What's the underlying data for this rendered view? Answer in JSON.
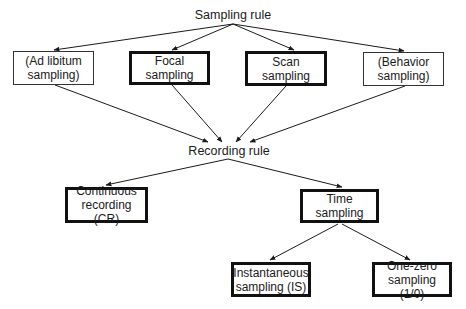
{
  "diagram": {
    "root": {
      "label": "Sampling rule"
    },
    "sampling_rules": [
      {
        "id": "ad-libitum",
        "lines": [
          "(Ad libitum",
          "sampling)"
        ],
        "emphasis": "thin"
      },
      {
        "id": "focal",
        "lines": [
          "Focal",
          "sampling"
        ],
        "emphasis": "thick"
      },
      {
        "id": "scan",
        "lines": [
          "Scan",
          "sampling"
        ],
        "emphasis": "thick"
      },
      {
        "id": "behavior",
        "lines": [
          "(Behavior",
          "sampling)"
        ],
        "emphasis": "thin"
      }
    ],
    "recording": {
      "label": "Recording rule"
    },
    "recording_rules": [
      {
        "id": "continuous",
        "lines": [
          "Continuous",
          "recording (CR)"
        ],
        "emphasis": "thick"
      },
      {
        "id": "time",
        "lines": [
          "Time sampling"
        ],
        "emphasis": "thick"
      }
    ],
    "time_sampling_types": [
      {
        "id": "instantaneous",
        "lines": [
          "Instantaneous",
          "sampling (IS)"
        ],
        "emphasis": "thick"
      },
      {
        "id": "one-zero",
        "lines": [
          "One-zero",
          "sampling (1/0)"
        ],
        "emphasis": "thick"
      }
    ],
    "edges": [
      [
        "Sampling rule",
        "(Ad libitum sampling)"
      ],
      [
        "Sampling rule",
        "Focal sampling"
      ],
      [
        "Sampling rule",
        "Scan sampling"
      ],
      [
        "Sampling rule",
        "(Behavior sampling)"
      ],
      [
        "(Ad libitum sampling)",
        "Recording rule"
      ],
      [
        "Focal sampling",
        "Recording rule"
      ],
      [
        "Scan sampling",
        "Recording rule"
      ],
      [
        "(Behavior sampling)",
        "Recording rule"
      ],
      [
        "Recording rule",
        "Continuous recording (CR)"
      ],
      [
        "Recording rule",
        "Time sampling"
      ],
      [
        "Time sampling",
        "Instantaneous sampling (IS)"
      ],
      [
        "Time sampling",
        "One-zero sampling (1/0)"
      ]
    ]
  }
}
